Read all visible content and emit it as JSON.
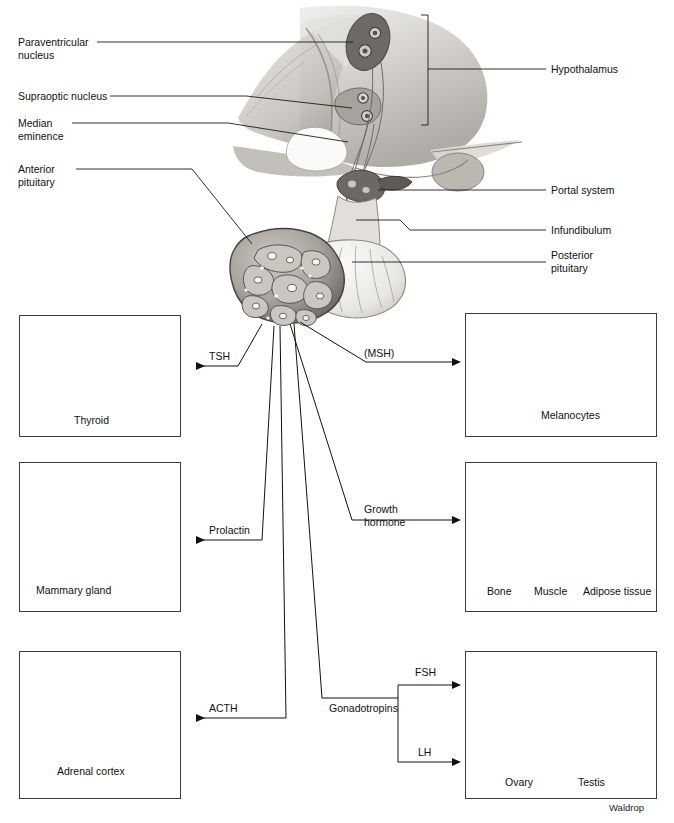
{
  "figure": {
    "credit": "Waldrop",
    "top_cut_text": "  --    --"
  },
  "anatomy_labels": {
    "left": [
      {
        "id": "paraventricular-nucleus",
        "text": "Paraventricular\nnucleus",
        "x": 18,
        "y": 36
      },
      {
        "id": "supraoptic-nucleus",
        "text": "Supraoptic nucleus",
        "x": 18,
        "y": 90
      },
      {
        "id": "median-eminence",
        "text": "Median\neminence",
        "x": 18,
        "y": 117
      },
      {
        "id": "anterior-pituitary",
        "text": "Anterior\npituitary",
        "x": 18,
        "y": 163
      }
    ],
    "right": [
      {
        "id": "hypothalamus",
        "text": "Hypothalamus",
        "x": 551,
        "y": 64
      },
      {
        "id": "portal-system",
        "text": "Portal system",
        "x": 551,
        "y": 185
      },
      {
        "id": "infundibulum",
        "text": "Infundibulum",
        "x": 551,
        "y": 225
      },
      {
        "id": "posterior-pituitary",
        "text": "Posterior\npituitary",
        "x": 551,
        "y": 252
      }
    ]
  },
  "hormones": [
    {
      "id": "tsh",
      "label": "TSH",
      "x": 209,
      "y": 350
    },
    {
      "id": "msh",
      "label": "(MSH)",
      "x": 364,
      "y": 348
    },
    {
      "id": "prolactin",
      "label": "Prolactin",
      "x": 209,
      "y": 528
    },
    {
      "id": "growth-hormone",
      "label": "Growth\nhormone",
      "x": 364,
      "y": 505
    },
    {
      "id": "acth",
      "label": "ACTH",
      "x": 209,
      "y": 705
    },
    {
      "id": "gonadotropins",
      "label": "Gonadotropins",
      "x": 329,
      "y": 705
    },
    {
      "id": "fsh",
      "label": "FSH",
      "x": 415,
      "y": 668
    },
    {
      "id": "lh",
      "label": "LH",
      "x": 418,
      "y": 749
    }
  ],
  "target_boxes": [
    {
      "id": "thyroid",
      "x": 19,
      "y": 315,
      "w": 162,
      "h": 122,
      "captions": [
        {
          "text": "Thyroid",
          "x": 74,
          "y": 415
        }
      ],
      "inner_labels": []
    },
    {
      "id": "skin-melanocytes",
      "x": 465,
      "y": 313,
      "w": 192,
      "h": 124,
      "captions": [],
      "inner_labels": [
        {
          "text": "Melanocytes",
          "x": 541,
          "y": 410
        }
      ]
    },
    {
      "id": "mammary-gland",
      "x": 19,
      "y": 462,
      "w": 162,
      "h": 150,
      "captions": [],
      "inner_labels": [
        {
          "text": "Mammary gland",
          "x": 36,
          "y": 595
        }
      ]
    },
    {
      "id": "growth-targets",
      "x": 465,
      "y": 462,
      "w": 192,
      "h": 150,
      "captions": [
        {
          "text": "Bone",
          "x": 487,
          "y": 590
        },
        {
          "text": "Muscle",
          "x": 540,
          "y": 590
        },
        {
          "text": "Adipose tissue",
          "x": 586,
          "y": 590
        }
      ],
      "inner_labels": []
    },
    {
      "id": "adrenal-cortex",
      "x": 19,
      "y": 651,
      "w": 162,
      "h": 148,
      "captions": [],
      "inner_labels": [
        {
          "text": "Adrenal cortex",
          "x": 57,
          "y": 775
        }
      ]
    },
    {
      "id": "gonads",
      "x": 465,
      "y": 651,
      "w": 192,
      "h": 148,
      "captions": [
        {
          "text": "Ovary",
          "x": 487,
          "y": 777
        },
        {
          "text": "Testis",
          "x": 578,
          "y": 777
        }
      ],
      "inner_labels": []
    }
  ],
  "colors": {
    "ink": "#111111",
    "line": "#1c1c1c",
    "box_border": "#3b3b3b",
    "tissue_light": "#dddad4",
    "tissue_mid": "#b5b1aa",
    "tissue_dark": "#7c7872",
    "brain_gray": "#cdcac5",
    "background": "#ffffff"
  }
}
